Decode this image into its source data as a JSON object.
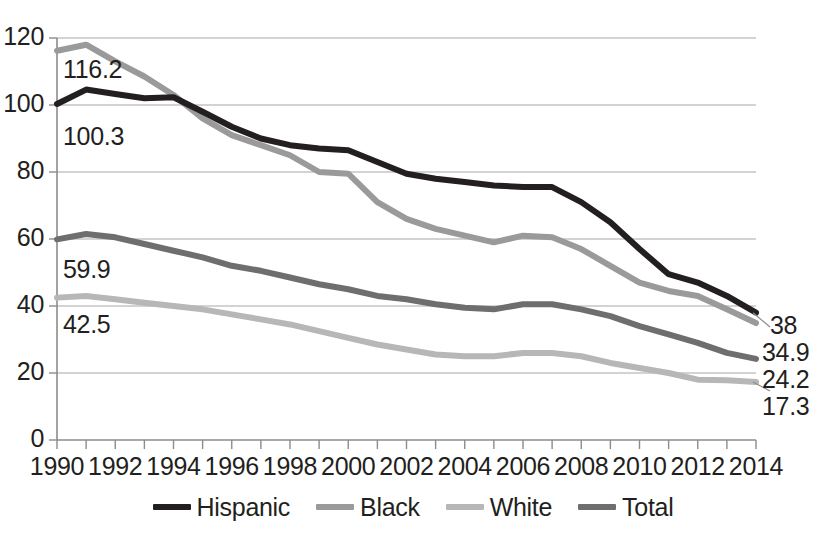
{
  "chart_data": {
    "type": "line",
    "title": "",
    "subtitle": "",
    "xlabel": "",
    "ylabel": "",
    "xlim": [
      1990,
      2014
    ],
    "ylim": [
      0,
      120
    ],
    "grid": true,
    "legend_position": "bottom",
    "x": [
      1990,
      1991,
      1992,
      1993,
      1994,
      1995,
      1996,
      1997,
      1998,
      1999,
      2000,
      2001,
      2002,
      2003,
      2004,
      2005,
      2006,
      2007,
      2008,
      2009,
      2010,
      2011,
      2012,
      2013,
      2014
    ],
    "x_tick_labels": [
      "1990",
      "1992",
      "1994",
      "1996",
      "1998",
      "2000",
      "2002",
      "2004",
      "2006",
      "2008",
      "2010",
      "2012",
      "2014"
    ],
    "y_tick_labels": [
      "0",
      "20",
      "40",
      "60",
      "80",
      "100",
      "120"
    ],
    "y_ticks": [
      0,
      20,
      40,
      60,
      80,
      100,
      120
    ],
    "series": [
      {
        "name": "Hispanic",
        "color": "#231f20",
        "values": [
          100.3,
          104.6,
          103.3,
          102.0,
          102.3,
          98.0,
          93.5,
          90.0,
          88.0,
          87.0,
          86.5,
          83.0,
          79.5,
          78.0,
          77.0,
          76.0,
          75.5,
          75.5,
          71.0,
          65.0,
          57.0,
          49.5,
          47.0,
          43.0,
          38.0
        ],
        "start_label": "100.3",
        "end_label": "38"
      },
      {
        "name": "Black",
        "color": "#9a9a9a",
        "values": [
          116.2,
          118.0,
          113.0,
          108.5,
          103.0,
          96.0,
          91.0,
          88.0,
          85.0,
          80.0,
          79.5,
          71.0,
          66.0,
          63.0,
          61.0,
          59.0,
          61.0,
          60.5,
          57.0,
          52.0,
          47.0,
          44.5,
          43.0,
          39.0,
          34.9
        ],
        "start_label": "116.2",
        "end_label": "34.9"
      },
      {
        "name": "White",
        "color": "#b7b7b7",
        "values": [
          42.5,
          43.0,
          42.0,
          41.0,
          40.0,
          39.0,
          37.5,
          36.0,
          34.5,
          32.5,
          30.5,
          28.5,
          27.0,
          25.5,
          25.0,
          25.0,
          26.0,
          26.0,
          25.0,
          23.0,
          21.5,
          20.0,
          18.0,
          17.8,
          17.3
        ],
        "start_label": "42.5",
        "end_label": "17.3"
      },
      {
        "name": "Total",
        "color": "#6e6e6e",
        "values": [
          59.9,
          61.5,
          60.5,
          58.5,
          56.5,
          54.5,
          52.0,
          50.5,
          48.5,
          46.5,
          45.0,
          43.0,
          42.0,
          40.5,
          39.5,
          39.0,
          40.5,
          40.5,
          39.0,
          37.0,
          34.0,
          31.5,
          29.0,
          26.0,
          24.2
        ],
        "start_label": "59.9",
        "end_label": "24.2"
      }
    ],
    "start_annotations": [
      {
        "text": "116.2",
        "series": "Black"
      },
      {
        "text": "100.3",
        "series": "Hispanic"
      },
      {
        "text": "59.9",
        "series": "Total"
      },
      {
        "text": "42.5",
        "series": "White"
      }
    ],
    "end_annotations": [
      {
        "text": "38",
        "series": "Hispanic"
      },
      {
        "text": "34.9",
        "series": "Black"
      },
      {
        "text": "24.2",
        "series": "Total"
      },
      {
        "text": "17.3",
        "series": "White"
      }
    ]
  },
  "legend": {
    "items": [
      {
        "label": "Hispanic",
        "color": "#231f20"
      },
      {
        "label": "Black",
        "color": "#9a9a9a"
      },
      {
        "label": "White",
        "color": "#b7b7b7"
      },
      {
        "label": "Total",
        "color": "#6e6e6e"
      }
    ]
  },
  "axis": {
    "y_labels": [
      "120",
      "100",
      "80",
      "60",
      "40",
      "20",
      "0"
    ],
    "x_labels": [
      "1990",
      "1992",
      "1994",
      "1996",
      "1998",
      "2000",
      "2002",
      "2004",
      "2006",
      "2008",
      "2010",
      "2012",
      "2014"
    ]
  },
  "colors": {
    "gridline": "#a7a7a7",
    "axis": "#8c8c8c",
    "text": "#231f20",
    "background": "#ffffff"
  }
}
